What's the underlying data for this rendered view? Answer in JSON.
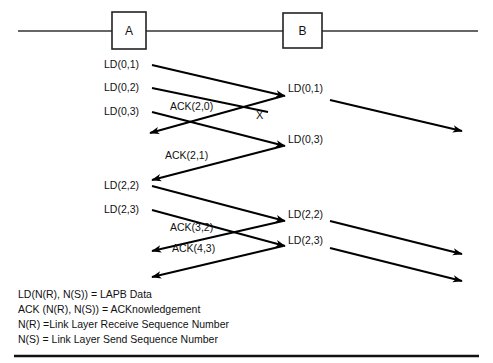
{
  "diagram": {
    "nodes": [
      {
        "id": "A",
        "label": "A"
      },
      {
        "id": "B",
        "label": "B"
      }
    ],
    "lost_marker": "X",
    "left_frames": [
      {
        "label": "LD(0,1)"
      },
      {
        "label": "LD(0,2)"
      },
      {
        "label": "LD(0,3)"
      },
      {
        "label": "LD(2,2)"
      },
      {
        "label": "LD(2,3)"
      }
    ],
    "mid_frames": [
      {
        "label": "ACK(2,0)"
      },
      {
        "label": "ACK(2,1)"
      },
      {
        "label": "ACK(3,2)"
      },
      {
        "label": "ACK(4,3)"
      }
    ],
    "right_frames": [
      {
        "label": "LD(0,1)"
      },
      {
        "label": "LD(0,3)"
      },
      {
        "label": "LD(2,2)"
      },
      {
        "label": "LD(2,3)"
      }
    ],
    "legend": [
      "LD(N(R), N(S)) = LAPB  Data",
      "ACK (N(R), N(S)) = ACKnowledgement",
      "N(R) =Link Layer  Receive Sequence Number",
      "N(S) = Link Layer Send Sequence Number"
    ]
  },
  "colors": {
    "line": "#333333",
    "arrow": "#000000",
    "box_stroke": "#222222",
    "background": "#ffffff",
    "text": "#111111"
  }
}
